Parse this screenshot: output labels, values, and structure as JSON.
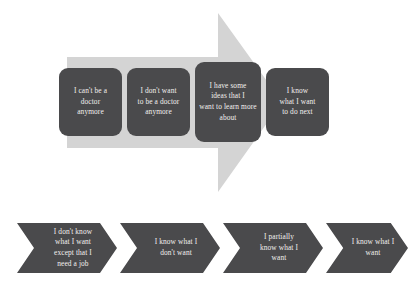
{
  "diagram": {
    "colors": {
      "box_fill": "#4a4a4c",
      "box_text": "#f2f0ee",
      "arrow_fill": "#d4d4d4",
      "background": "#ffffff"
    },
    "background_arrow": {
      "name": "right-pointing-arrow",
      "direction": "right"
    },
    "top_row": {
      "name": "stages-of-knowing",
      "boxes": [
        {
          "id": "stage-1",
          "text": "I can't be a\ndoctor\nanymore"
        },
        {
          "id": "stage-2",
          "text": "I don't want\nto be a doctor\nanymore"
        },
        {
          "id": "stage-3",
          "text": "I have some\nideas that I\nwant to learn more\nabout"
        },
        {
          "id": "stage-4",
          "text": "I know\nwhat I want\nto do next"
        }
      ]
    },
    "bottom_row": {
      "name": "stages-of-wanting",
      "chevrons": [
        {
          "id": "chevron-1",
          "text": "I don't know\nwhat I want\nexcept that I\nneed a job"
        },
        {
          "id": "chevron-2",
          "text": "I know what I\ndon't want"
        },
        {
          "id": "chevron-3",
          "text": "I partially\nknow what I\nwant"
        },
        {
          "id": "chevron-4",
          "text": "I know what I\nwant"
        }
      ]
    }
  }
}
